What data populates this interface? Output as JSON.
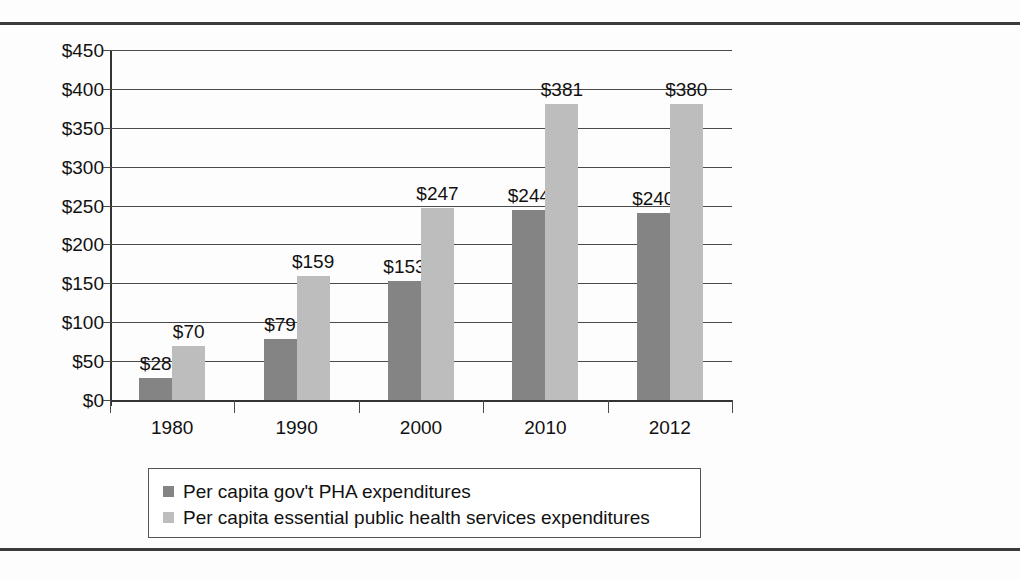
{
  "chart_data": {
    "type": "bar",
    "title": "",
    "xlabel": "",
    "ylabel": "",
    "categories": [
      "1980",
      "1990",
      "2000",
      "2010",
      "2012"
    ],
    "series": [
      {
        "name": "Per capita gov't PHA expenditures",
        "color": "#848484",
        "values": [
          28,
          79,
          153,
          244,
          240
        ],
        "labels": [
          "$28",
          "$79",
          "$153",
          "$244",
          "$240"
        ]
      },
      {
        "name": "Per capita essential public health services expenditures",
        "color": "#bdbdbd",
        "values": [
          70,
          159,
          247,
          381,
          380
        ],
        "labels": [
          "$70",
          "$159",
          "$247",
          "$381",
          "$380"
        ]
      }
    ],
    "ylim": [
      0,
      450
    ],
    "yticks": [
      0,
      50,
      100,
      150,
      200,
      250,
      300,
      350,
      400,
      450
    ],
    "ytick_labels": [
      "$0",
      "$50",
      "$100",
      "$150",
      "$200",
      "$250",
      "$300",
      "$350",
      "$400",
      "$450"
    ],
    "grid": true,
    "legend_position": "bottom",
    "data_labels": true
  },
  "legend": {
    "items": [
      {
        "label": "Per capita gov't PHA expenditures",
        "swatch": "#848484"
      },
      {
        "label": "Per capita essential public health services expenditures",
        "swatch": "#bdbdbd"
      }
    ]
  }
}
